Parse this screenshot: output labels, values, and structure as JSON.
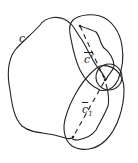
{
  "diagram": {
    "labels": {
      "curve_c": "c",
      "curve_c_prime": "c'",
      "curve_c1": "c",
      "curve_c1_sub": "1"
    },
    "colors": {
      "stroke": "#222222",
      "background": "#ffffff"
    }
  }
}
